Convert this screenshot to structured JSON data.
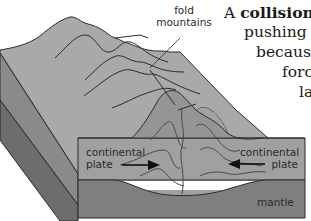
{
  "diagram": {
    "labels": {
      "fold_mountains_line1": "fold",
      "fold_mountains_line2": "mountains",
      "left_plate_line1": "continental",
      "left_plate_line2": "plate",
      "right_plate_line1": "continental",
      "right_plate_line2": "plate",
      "mantle": "mantle"
    },
    "arrows": {
      "left": "right-pointing arrow (left plate moving right)",
      "right": "left-pointing arrow (right plate moving left)"
    },
    "colors": {
      "surface": "#a9a9a9",
      "crust_front": "#9a9a9a",
      "mountain_root": "#8f8f8f",
      "mantle_front": "#7d7d7d",
      "side_upper": "#858585",
      "side_lower": "#6a6a6a",
      "lines": "#2b2b2b"
    }
  },
  "caption": {
    "line1_prefix": "A ",
    "line1_bold": "collision b",
    "line2": "pushing tog",
    "line3": "because",
    "line4": "force",
    "line5": "la"
  }
}
